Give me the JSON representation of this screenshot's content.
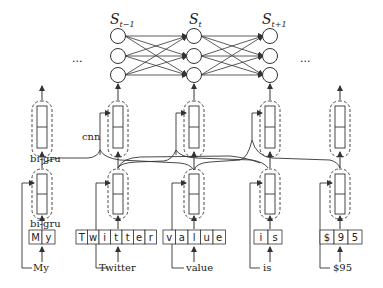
{
  "diagram": {
    "states": {
      "labels": [
        "S",
        "S",
        "S"
      ],
      "subscripts": [
        "t−1",
        "t",
        "t+1"
      ],
      "ellipsis_left": "...",
      "ellipsis_right": "..."
    },
    "labels": {
      "cnn": "cnn",
      "bigru_top": "bi-gru",
      "bigru_bottom": "bi-gru"
    },
    "words": [
      {
        "word": "My",
        "chars": [
          "M",
          "y"
        ]
      },
      {
        "word": "Twitter",
        "chars": [
          "T",
          "w",
          "i",
          "t",
          "t",
          "e",
          "r"
        ]
      },
      {
        "word": "value",
        "chars": [
          "v",
          "a",
          "l",
          "u",
          "e"
        ]
      },
      {
        "word": "is",
        "chars": [
          "i",
          "s"
        ]
      },
      {
        "word": "$95",
        "chars": [
          "$",
          "9",
          "5"
        ]
      }
    ],
    "colors": {
      "stroke": "#333333",
      "background": "#ffffff"
    }
  }
}
